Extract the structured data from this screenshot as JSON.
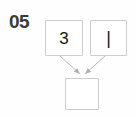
{
  "diagram": {
    "index_label": "05",
    "background_color": "#fefefe",
    "box_border_color": "#cdcdcd",
    "box_fill_color": "#ffffff",
    "edge_color": "#b4b4b4",
    "text_color": "#141414",
    "index_color": "#3a3a3a",
    "nodes": [
      {
        "id": "top-left",
        "label": "3",
        "x": 45,
        "y": 20,
        "width": 38,
        "height": 36
      },
      {
        "id": "top-right",
        "label": "|",
        "x": 90,
        "y": 20,
        "width": 37,
        "height": 36
      },
      {
        "id": "bottom",
        "label": "",
        "x": 65,
        "y": 78,
        "width": 34,
        "height": 32
      }
    ],
    "edges": [
      {
        "id": "edge-top-left-to-bottom",
        "from": "top-left",
        "to": "bottom",
        "x1": 60,
        "y1": 56,
        "x2": 79,
        "y2": 75,
        "arrowhead": "filled-triangle"
      },
      {
        "id": "edge-top-right-to-bottom",
        "from": "top-right",
        "to": "bottom",
        "x1": 105,
        "y1": 56,
        "x2": 85,
        "y2": 75,
        "arrowhead": "filled-triangle"
      }
    ]
  }
}
